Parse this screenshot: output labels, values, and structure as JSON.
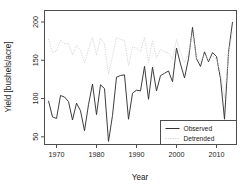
{
  "chart_data": {
    "type": "line",
    "title": "",
    "xlabel": "Year",
    "ylabel": "Yield [bushels/acre]",
    "xlim": [
      1967,
      2015
    ],
    "ylim": [
      40,
      215
    ],
    "grid": false,
    "legend_position": "bottom-right",
    "xticks": [
      1970,
      1980,
      1990,
      2000,
      2010
    ],
    "xtick_labels": [
      "1970",
      "1980",
      "1990",
      "2000",
      "2010"
    ],
    "yticks": [
      50,
      100,
      150,
      200
    ],
    "ytick_labels": [
      "50",
      "100",
      "150",
      "200"
    ],
    "x": [
      1968,
      1969,
      1970,
      1971,
      1972,
      1973,
      1974,
      1975,
      1976,
      1977,
      1978,
      1979,
      1980,
      1981,
      1982,
      1983,
      1984,
      1985,
      1986,
      1987,
      1988,
      1989,
      1990,
      1991,
      1992,
      1993,
      1994,
      1995,
      1996,
      1997,
      1998,
      1999,
      2000,
      2001,
      2002,
      2003,
      2004,
      2005,
      2006,
      2007,
      2008,
      2009,
      2010,
      2011,
      2012,
      2013,
      2014
    ],
    "series": [
      {
        "name": "Observed",
        "color": "#333333",
        "style": "solid",
        "values": [
          97,
          76,
          74,
          104,
          102,
          96,
          72,
          94,
          84,
          58,
          92,
          119,
          79,
          118,
          113,
          44,
          78,
          128,
          130,
          131,
          73,
          107,
          111,
          110,
          142,
          99,
          141,
          110,
          130,
          133,
          136,
          122,
          166,
          145,
          127,
          152,
          193,
          152,
          142,
          161,
          148,
          160,
          155,
          126,
          73,
          160,
          200
        ]
      },
      {
        "name": "Detrended",
        "color": "#d4d4d4",
        "style": "dotted",
        "values": [
          178,
          160,
          162,
          177,
          172,
          172,
          157,
          170,
          163,
          146,
          164,
          180,
          157,
          179,
          172,
          132,
          155,
          180,
          177,
          176,
          143,
          167,
          166,
          161,
          180,
          147,
          176,
          153,
          164,
          161,
          160,
          151,
          177,
          159,
          147,
          159,
          186,
          153,
          148,
          158,
          150,
          156,
          152,
          133,
          100,
          157,
          188
        ]
      }
    ]
  },
  "legend": {
    "items": [
      {
        "label": "Observed"
      },
      {
        "label": "Detrended"
      }
    ]
  }
}
